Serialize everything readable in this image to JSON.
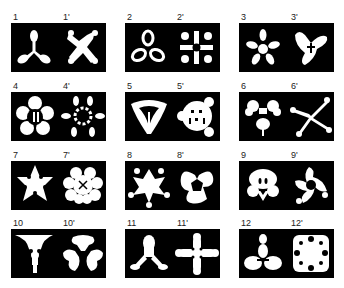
{
  "figure": {
    "pairs": [
      {
        "label": "1",
        "label_prime": "1'",
        "shape": "three-lobed propeller",
        "shape_prime": "four-armed irregular star"
      },
      {
        "label": "2",
        "label_prime": "2'",
        "shape": "three-loop trefoil",
        "shape_prime": "ornate four-fold cross"
      },
      {
        "label": "3",
        "label_prime": "3'",
        "shape": "five-petal asterisk",
        "shape_prime": "curved three-arm blob"
      },
      {
        "label": "4",
        "label_prime": "4'",
        "shape": "five-petal flower",
        "shape_prime": "ring of six petals"
      },
      {
        "label": "5",
        "label_prime": "5'",
        "shape": "rounded triangle emblem",
        "shape_prime": "three-lobed face"
      },
      {
        "label": "6",
        "label_prime": "6'",
        "shape": "clustered blob",
        "shape_prime": "spiky five-arm star"
      },
      {
        "label": "7",
        "label_prime": "7'",
        "shape": "five-point star with holes",
        "shape_prime": "eight-lobe flower"
      },
      {
        "label": "8",
        "label_prime": "8'",
        "shape": "five-point knobbed star",
        "shape_prime": "butterfly form"
      },
      {
        "label": "9",
        "label_prime": "9'",
        "shape": "skull-like form",
        "shape_prime": "three-arm pinwheel"
      },
      {
        "label": "10",
        "label_prime": "10'",
        "shape": "funnel with figure",
        "shape_prime": "three-lobe cluster"
      },
      {
        "label": "11",
        "label_prime": "11'",
        "shape": "tripod blob",
        "shape_prime": "four-arm cross"
      },
      {
        "label": "12",
        "label_prime": "12'",
        "shape": "stacked lobes",
        "shape_prime": "square lace pattern"
      }
    ]
  }
}
